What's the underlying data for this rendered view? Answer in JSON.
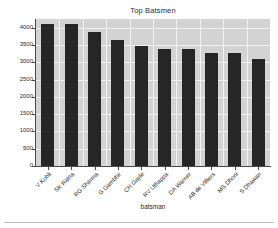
{
  "chart_data": {
    "type": "bar",
    "title": "Top Batsmen",
    "xlabel": "batsman",
    "ylabel": "",
    "categories": [
      "V Kohli",
      "SK Raina",
      "RG Sharma",
      "G Gambhir",
      "CH Gayle",
      "RV Uthappa",
      "DA Warner",
      "AB de Villiers",
      "MS Dhoni",
      "S Dhawan"
    ],
    "values": [
      4110,
      4100,
      3880,
      3630,
      3460,
      3390,
      3370,
      3270,
      3270,
      3090
    ],
    "ylim": [
      0,
      4250
    ],
    "yticks": [
      0,
      500,
      1000,
      1500,
      2000,
      2500,
      3000,
      3500,
      4000
    ],
    "ytick_labels": [
      "0",
      "500",
      "1000",
      "1500",
      "2000",
      "2500",
      "3000",
      "3500",
      "4000"
    ],
    "grid": true,
    "legend": null,
    "bar_color": "#262626",
    "plot_background": "#d3d3d3",
    "grid_color": "#f2f2f2",
    "figure_background": "#ffffff",
    "xtick_rotation": -45
  }
}
